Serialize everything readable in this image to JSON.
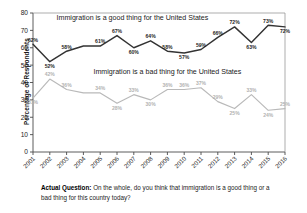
{
  "chart_data": {
    "type": "line",
    "title": "",
    "xlabel": "",
    "ylabel": "Percentage of Respondents",
    "ylim": [
      0,
      80
    ],
    "ytick_step": 10,
    "yticks": [
      "0",
      "10",
      "20",
      "30",
      "40",
      "50",
      "60",
      "70",
      "80"
    ],
    "grid": false,
    "legend_position": "inline-annotation",
    "categories": [
      "2001",
      "2002",
      "2003",
      "2004",
      "2005",
      "2006",
      "2007",
      "2008",
      "2009",
      "2010",
      "2011",
      "2012",
      "2013",
      "2014",
      "2015",
      "2016"
    ],
    "series": [
      {
        "name": "Immigration is a good thing for the United States",
        "color": "#333333",
        "values": [
          62,
          52,
          58,
          61,
          61,
          67,
          60,
          64,
          58,
          57,
          59,
          66,
          72,
          63,
          73,
          72
        ],
        "point_labels": [
          "62%",
          "52%",
          "58%",
          "",
          "61%",
          "67%",
          "60%",
          "64%",
          "58%",
          "57%",
          "59%",
          "66%",
          "72%",
          "63%",
          "73%",
          "72%"
        ]
      },
      {
        "name": "Immigration is a bad thing for the United States",
        "color": "#b9b9b9",
        "values": [
          31,
          42,
          36,
          34,
          34,
          28,
          33,
          30,
          36,
          36,
          37,
          29,
          25,
          33,
          24,
          25
        ],
        "point_labels": [
          "31%",
          "42%",
          "36%",
          "",
          "34%",
          "28%",
          "33%",
          "30%",
          "36%",
          "36%",
          "37%",
          "29%",
          "25%",
          "33%",
          "24%",
          "25%"
        ]
      }
    ],
    "annotations": [
      {
        "text": "Immigration is a good thing for the United States",
        "x": 2002.4,
        "y": 76
      },
      {
        "text": "Immigration is a bad thing for the United States",
        "x": 2004.6,
        "y": 45
      }
    ]
  },
  "caption": {
    "lead": "Actual Question:",
    "body": " On the whole, do you think that immigration is a good thing or a bad thing for this country today?"
  }
}
